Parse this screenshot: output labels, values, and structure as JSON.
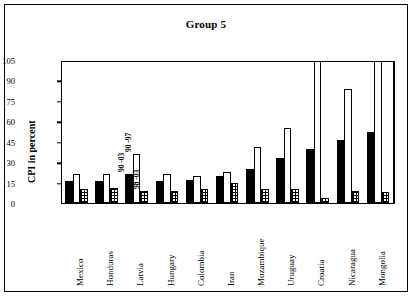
{
  "chart_data": {
    "type": "bar",
    "title": "Group 5",
    "xlabel": "",
    "ylabel": "CPI in percent",
    "ylim": [
      0,
      105
    ],
    "yticks": [
      0,
      15,
      30,
      45,
      60,
      75,
      90,
      105
    ],
    "grid": false,
    "legend": null,
    "categories": [
      "Mexico",
      "Honduras",
      "Latvia",
      "Hungary",
      "Colombia",
      "Iran",
      "Mozambique",
      "Uruguay",
      "Croatia",
      "Nicaragua",
      "Mongolia"
    ],
    "series": [
      {
        "name": "series-1-solid-black",
        "values": [
          16,
          16,
          21,
          16,
          17,
          20,
          25,
          33,
          40,
          46,
          52
        ]
      },
      {
        "name": "series-2-open-white",
        "values": [
          21,
          21,
          36,
          21,
          20,
          23,
          41,
          55,
          105,
          84,
          105
        ]
      },
      {
        "name": "series-3-hatched",
        "values": [
          10,
          11,
          9,
          9,
          10,
          15,
          10,
          10,
          4,
          9,
          8
        ]
      }
    ],
    "clipped_at_top": [
      "Croatia.series-2-open-white",
      "Mongolia.series-2-open-white",
      "Mongolia.series-3-hatched"
    ],
    "annotations": [
      {
        "text": "90 -03",
        "near": "Latvia.series-1-solid-black"
      },
      {
        "text": "90 -97",
        "near": "Latvia.series-2-open-white"
      },
      {
        "text": "98 -03",
        "near": "Latvia.series-3-hatched"
      }
    ]
  }
}
